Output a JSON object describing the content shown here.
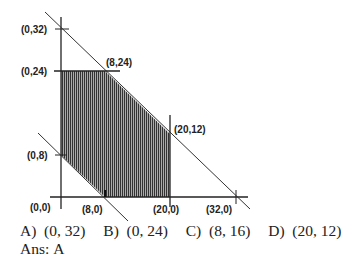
{
  "diagram": {
    "type": "feasible-region-graph",
    "points": {
      "p_0_32": "(0,32)",
      "p_0_24": "(0,24)",
      "p_8_24": "(8,24)",
      "p_20_12": "(20,12)",
      "p_0_8": "(0,8)",
      "p_0_0": "(0,0)",
      "p_8_0": "(8,0)",
      "p_20_0": "(20,0)",
      "p_32_0": "(32,0)"
    },
    "shaded_region_vertices": [
      [
        0,
        24
      ],
      [
        8,
        24
      ],
      [
        20,
        12
      ],
      [
        20,
        0
      ],
      [
        8,
        0
      ],
      [
        0,
        8
      ]
    ],
    "lines": [
      {
        "name": "x+y=32",
        "from": [
          0,
          32
        ],
        "to": [
          32,
          0
        ]
      },
      {
        "name": "x+y=8",
        "from": [
          0,
          8
        ],
        "to": [
          8,
          0
        ]
      },
      {
        "name": "y=24",
        "value": 24
      },
      {
        "name": "x=20",
        "value": 20
      }
    ],
    "shade_color": "#555555",
    "line_color": "#333333"
  },
  "question": {
    "options": [
      {
        "letter": "A)",
        "value": "(0, 32)"
      },
      {
        "letter": "B)",
        "value": "(0, 24)"
      },
      {
        "letter": "C)",
        "value": "(8, 16)"
      },
      {
        "letter": "D)",
        "value": "(20, 12)"
      }
    ],
    "answer_label": "Ans:",
    "answer_value": "A"
  }
}
